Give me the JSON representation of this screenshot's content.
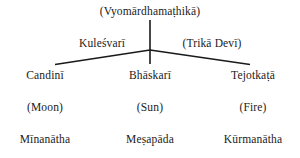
{
  "diagram": {
    "type": "hierarchical-tree",
    "line_color": "#1a1a1a",
    "background_color": "#ffffff",
    "text_color": "#1a1a1a",
    "root": {
      "label": "(Vyomārdhamaṭhikā)"
    },
    "branch_titles": [
      {
        "id": "kulesvari",
        "label": "Kuleśvarī",
        "side": "left"
      },
      {
        "id": "trika",
        "label": "(Trikā Devī)",
        "side": "right"
      }
    ],
    "columns": [
      {
        "id": "left",
        "deity": "Candinī",
        "element": "(Moon)",
        "master": "Mīnanātha"
      },
      {
        "id": "center",
        "deity": "Bhāskarī",
        "element": "(Sun)",
        "master": "Meṣapāda"
      },
      {
        "id": "right",
        "deity": "Tejotkaṭā",
        "element": "(Fire)",
        "master": "Kūrmanātha"
      }
    ],
    "connectors": {
      "junction_x": 150,
      "junction_y": 50,
      "stem_top_y": 20,
      "stem_bottom_y": 64,
      "left_end_x": 55,
      "left_end_y": 64,
      "right_end_x": 250,
      "right_end_y": 64
    }
  }
}
